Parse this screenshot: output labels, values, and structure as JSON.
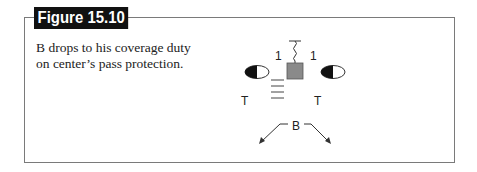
{
  "figure": {
    "title": "Figure 15.10",
    "caption": "B drops to his coverage duty on center’s pass protection."
  },
  "diagram": {
    "labels": {
      "gap_left": "1",
      "gap_right": "1",
      "tackle_left": "T",
      "tackle_right": "T",
      "back": "B"
    },
    "colors": {
      "center_fill": "#8a8a8a",
      "stroke": "#333333",
      "frame": "#7a7a7a",
      "title_bg": "#111111"
    }
  }
}
